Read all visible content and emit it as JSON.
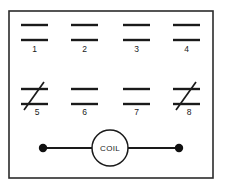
{
  "diagram": {
    "background_color": "#ffffff",
    "line_color": "#1a1a1a",
    "border_color": "#2b2b2b",
    "panel": {
      "x": 9,
      "y": 11,
      "width": 204,
      "height": 167
    },
    "rows": [
      {
        "row_name": "upper-contact-row",
        "line_y_top": 25,
        "line_y_bottom": 40,
        "label_y": 52,
        "contacts": [
          {
            "number": "1",
            "type": "normally-open",
            "slashed": false,
            "x_start": 21,
            "x_end": 48
          },
          {
            "number": "2",
            "type": "normally-open",
            "slashed": false,
            "x_start": 71,
            "x_end": 98
          },
          {
            "number": "3",
            "type": "normally-open",
            "slashed": false,
            "x_start": 123,
            "x_end": 150
          },
          {
            "number": "4",
            "type": "normally-open",
            "slashed": false,
            "x_start": 173,
            "x_end": 200
          }
        ]
      },
      {
        "row_name": "lower-contact-row",
        "line_y_top": 89,
        "line_y_bottom": 104,
        "label_y": 115,
        "contacts": [
          {
            "number": "5",
            "type": "normally-closed",
            "slashed": true,
            "x_start": 21,
            "x_end": 48
          },
          {
            "number": "6",
            "type": "normally-open",
            "slashed": false,
            "x_start": 71,
            "x_end": 98
          },
          {
            "number": "7",
            "type": "normally-open",
            "slashed": false,
            "x_start": 123,
            "x_end": 150
          },
          {
            "number": "8",
            "type": "normally-closed",
            "slashed": true,
            "x_start": 173,
            "x_end": 200
          }
        ]
      }
    ],
    "coil": {
      "label": "COIL",
      "center_x": 110,
      "center_y": 148,
      "radius": 18,
      "wire_y": 148,
      "left_terminal_x": 43,
      "right_terminal_x": 179,
      "terminal_radius": 4.2
    }
  }
}
